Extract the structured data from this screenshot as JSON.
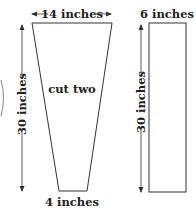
{
  "diagram": {
    "pieces": [
      {
        "name": "trapezoid",
        "top_width_label": "14 inches",
        "bottom_width_label": "4 inches",
        "height_label": "30 inches",
        "center_label": "cut two"
      },
      {
        "name": "rectangle",
        "width_label": "6 inches",
        "height_label": "30 inches"
      }
    ],
    "colors": {
      "line": "#333333",
      "text": "#222222",
      "background": "#ffffff"
    }
  }
}
